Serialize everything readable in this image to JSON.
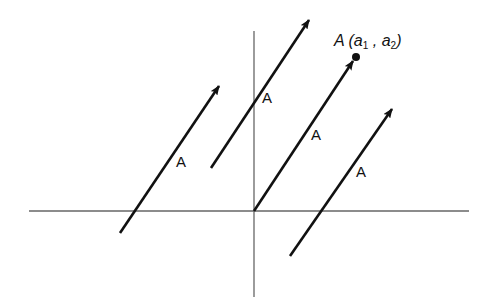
{
  "diagram": {
    "axes": {
      "x_axis": {
        "x1": 29,
        "y1": 211,
        "x2": 469,
        "y2": 211
      },
      "y_axis": {
        "x1": 254,
        "y1": 31,
        "x2": 254,
        "y2": 297
      },
      "color": "#666666"
    },
    "vectors": [
      {
        "label": "A",
        "from": [
          120,
          233
        ],
        "to": [
          219,
          86
        ],
        "label_pos": [
          176,
          167
        ]
      },
      {
        "label": "A",
        "from": [
          211,
          168
        ],
        "to": [
          309,
          20
        ],
        "label_pos": [
          262,
          103
        ]
      },
      {
        "label": "A",
        "from": [
          254,
          211
        ],
        "to": [
          353,
          61
        ],
        "label_pos": [
          311,
          140
        ]
      },
      {
        "label": "A",
        "from": [
          290,
          256
        ],
        "to": [
          392,
          109
        ],
        "label_pos": [
          356,
          177
        ]
      }
    ],
    "point": {
      "x": 356,
      "y": 57,
      "label_main": "A",
      "label_open": "(a",
      "sub1": "1",
      "label_sep": " , a",
      "sub2": "2",
      "label_close": ")"
    },
    "stroke_color": "#111111"
  }
}
